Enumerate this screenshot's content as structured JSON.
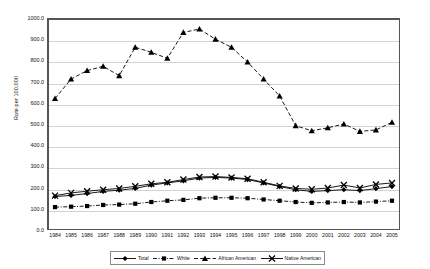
{
  "chart_data": {
    "type": "line",
    "title": "",
    "xlabel": "",
    "ylabel": "Rate per 100,000",
    "ylim": [
      0,
      1000
    ],
    "ytick_labels": [
      "1000.0",
      "900.0",
      "800.0",
      "700.0",
      "600.0",
      "500.0",
      "400.0",
      "300.0",
      "200.0",
      "100.0",
      "0.0"
    ],
    "yticks": [
      1000,
      900,
      800,
      700,
      600,
      500,
      400,
      300,
      200,
      100,
      0
    ],
    "grid": true,
    "legend_position": "bottom",
    "categories": [
      "1984",
      "1985",
      "1986",
      "1987",
      "1988",
      "1989",
      "1990",
      "1991",
      "1992",
      "1993",
      "1994",
      "1995",
      "1996",
      "1997",
      "1998",
      "1999",
      "2000",
      "2001",
      "2002",
      "2003",
      "2004",
      "2005"
    ],
    "series": [
      {
        "name": "Total",
        "marker": "diamond",
        "line": "solid",
        "color": "#000000",
        "values": [
          158,
          163,
          172,
          182,
          188,
          196,
          212,
          222,
          232,
          245,
          248,
          245,
          238,
          222,
          205,
          190,
          182,
          186,
          190,
          186,
          195,
          205
        ]
      },
      {
        "name": "White",
        "marker": "square",
        "line": "dash-dot",
        "color": "#000000",
        "values": [
          108,
          110,
          113,
          118,
          120,
          124,
          132,
          138,
          142,
          150,
          152,
          152,
          150,
          144,
          138,
          132,
          128,
          130,
          132,
          130,
          134,
          138
        ]
      },
      {
        "name": "African American",
        "marker": "triangle",
        "line": "dashed",
        "color": "#000000",
        "values": [
          620,
          712,
          752,
          772,
          728,
          862,
          838,
          810,
          932,
          948,
          900,
          862,
          792,
          712,
          632,
          492,
          468,
          482,
          500,
          465,
          472,
          508
        ]
      },
      {
        "name": "Native American",
        "marker": "x",
        "line": "solid",
        "color": "#000000",
        "values": [
          162,
          175,
          183,
          190,
          196,
          206,
          218,
          225,
          238,
          250,
          252,
          248,
          242,
          225,
          208,
          196,
          192,
          198,
          212,
          198,
          215,
          222
        ]
      }
    ]
  },
  "legend": {
    "items": [
      {
        "label": "Total"
      },
      {
        "label": "White"
      },
      {
        "label": "African American"
      },
      {
        "label": "Native American"
      }
    ]
  }
}
